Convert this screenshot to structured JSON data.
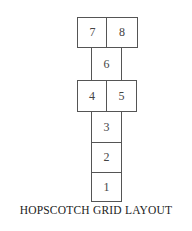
{
  "diagram": {
    "title": "HOPSCOTCH GRID LAYOUT",
    "squares": [
      {
        "label": "1",
        "row": "bottom",
        "position": "single"
      },
      {
        "label": "2",
        "row": "2",
        "position": "single"
      },
      {
        "label": "3",
        "row": "3",
        "position": "single"
      },
      {
        "label": "4",
        "row": "4-5",
        "position": "left"
      },
      {
        "label": "5",
        "row": "4-5",
        "position": "right"
      },
      {
        "label": "6",
        "row": "6",
        "position": "single"
      },
      {
        "label": "7",
        "row": "7-8",
        "position": "left"
      },
      {
        "label": "8",
        "row": "7-8",
        "position": "right"
      }
    ],
    "colors": {
      "border": "#555555",
      "fill": "#ffffff",
      "text": "#444444"
    }
  }
}
